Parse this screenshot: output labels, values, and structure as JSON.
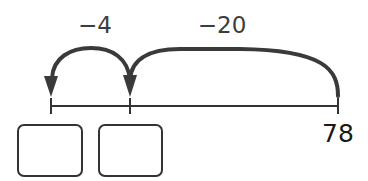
{
  "diagram": {
    "type": "number-line-jumps",
    "stroke_color": "#3a3a3a",
    "line_color": "#333333",
    "number_line": {
      "ticks": [
        {
          "id": "left",
          "value": "",
          "x": 51
        },
        {
          "id": "middle",
          "value": "",
          "x": 130
        },
        {
          "id": "right",
          "value": "78",
          "x": 338
        }
      ]
    },
    "jumps": [
      {
        "id": "jump-20",
        "label": "−20",
        "from": "78",
        "to": "middle"
      },
      {
        "id": "jump-4",
        "label": "−4",
        "from": "middle",
        "to": "left"
      }
    ],
    "endpoint_label": "78",
    "answer_boxes": [
      {
        "id": "box-1",
        "under_tick": "left",
        "value": ""
      },
      {
        "id": "box-2",
        "under_tick": "middle",
        "value": ""
      }
    ]
  }
}
